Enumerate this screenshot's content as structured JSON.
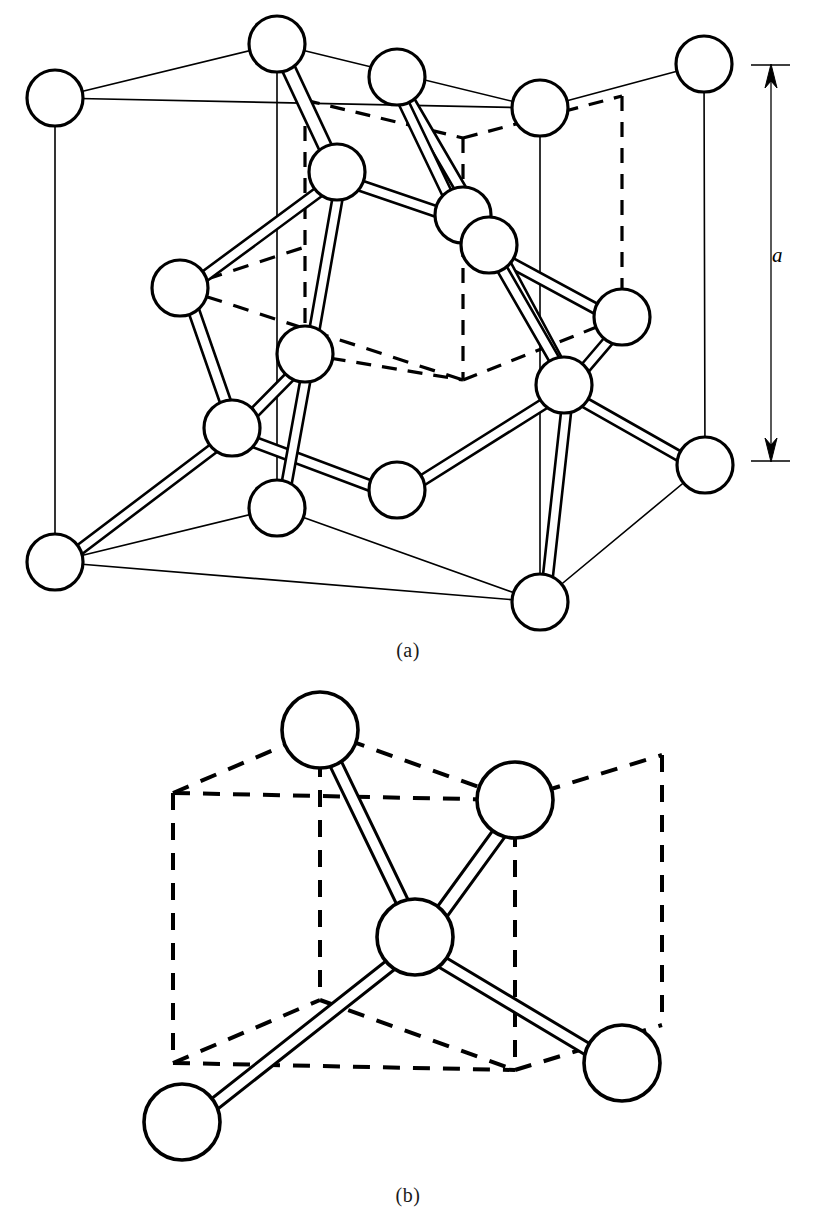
{
  "figure": {
    "kind": "crystal-structure-unit-cell-diagram",
    "style": {
      "line_color": "#000000",
      "atom_fill": "#ffffff",
      "atom_stroke": "#000000",
      "background": "#ffffff",
      "bond_fill": "#ffffff"
    },
    "panels": [
      {
        "id": "a",
        "caption": "(a)",
        "name": "diamond-cubic-unit-cell",
        "dimension": {
          "label": "a",
          "arrow": "double-headed-vertical"
        },
        "atom_count": 18,
        "atom_radius": 28,
        "atoms": [
          {
            "id": "c-back-top-left",
            "cx": 55,
            "cy": 98,
            "role": "cube-corner"
          },
          {
            "id": "c-front-top-left",
            "cx": 277,
            "cy": 44,
            "role": "cube-corner"
          },
          {
            "id": "c-front-top-right",
            "cx": 540,
            "cy": 108,
            "role": "cube-corner"
          },
          {
            "id": "c-back-top-right",
            "cx": 704,
            "cy": 64,
            "role": "cube-corner"
          },
          {
            "id": "c-back-bot-left",
            "cx": 55,
            "cy": 562,
            "role": "cube-corner"
          },
          {
            "id": "c-front-bot-left",
            "cx": 277,
            "cy": 508,
            "role": "cube-corner"
          },
          {
            "id": "c-front-bot-right",
            "cx": 540,
            "cy": 602,
            "role": "cube-corner"
          },
          {
            "id": "c-back-bot-right",
            "cx": 705,
            "cy": 465,
            "role": "cube-corner"
          },
          {
            "id": "f-top",
            "cx": 397,
            "cy": 77,
            "role": "face-center"
          },
          {
            "id": "f-left",
            "cx": 180,
            "cy": 288,
            "role": "face-center"
          },
          {
            "id": "f-right",
            "cx": 622,
            "cy": 317,
            "role": "face-center"
          },
          {
            "id": "f-bottom",
            "cx": 397,
            "cy": 490,
            "role": "face-center"
          },
          {
            "id": "f-front",
            "cx": 305,
            "cy": 354,
            "role": "face-center"
          },
          {
            "id": "f-back",
            "cx": 463,
            "cy": 215,
            "role": "face-center"
          },
          {
            "id": "t-upper-left",
            "cx": 337,
            "cy": 172,
            "role": "tetrahedral-interior"
          },
          {
            "id": "t-upper-right",
            "cx": 489,
            "cy": 245,
            "role": "tetrahedral-interior"
          },
          {
            "id": "t-lower-left",
            "cx": 232,
            "cy": 428,
            "role": "tetrahedral-interior"
          },
          {
            "id": "t-lower-right",
            "cx": 564,
            "cy": 385,
            "role": "tetrahedral-interior"
          }
        ]
      },
      {
        "id": "b",
        "caption": "(b)",
        "name": "tetrahedral-bonding-unit",
        "atom_count": 5,
        "atom_radius": 38,
        "atoms": [
          {
            "id": "b-center",
            "cx": 415,
            "cy": 937,
            "role": "tetrahedral-center"
          },
          {
            "id": "b-top-left",
            "cx": 320,
            "cy": 730,
            "role": "cube-corner"
          },
          {
            "id": "b-top-right",
            "cx": 515,
            "cy": 800,
            "role": "cube-corner"
          },
          {
            "id": "b-bottom-left",
            "cx": 182,
            "cy": 1122,
            "role": "cube-corner"
          },
          {
            "id": "b-bottom-right",
            "cx": 622,
            "cy": 1063,
            "role": "cube-corner"
          }
        ]
      }
    ]
  }
}
